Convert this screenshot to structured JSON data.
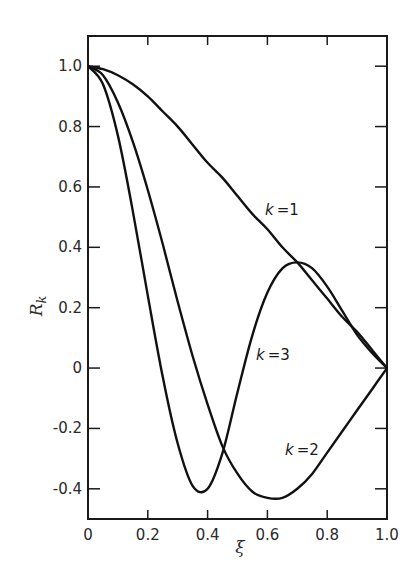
{
  "chart_data": {
    "type": "line",
    "title": "",
    "xlabel": "ξ",
    "ylabel": "R_k",
    "ylabel_main": "R",
    "ylabel_sub": "k",
    "xlim": [
      0,
      1.0
    ],
    "ylim": [
      -0.5,
      1.1
    ],
    "grid": false,
    "legend": "inline labels",
    "x_ticks": [
      "0",
      "0.2",
      "0.4",
      "0.6",
      "0.8",
      "1.0"
    ],
    "y_ticks": [
      "1.0",
      "0.8",
      "0.6",
      "0.4",
      "0.2",
      "0",
      "-0.2",
      "-0.4"
    ],
    "x": [
      0,
      0.05,
      0.1,
      0.15,
      0.2,
      0.25,
      0.3,
      0.35,
      0.4,
      0.45,
      0.5,
      0.55,
      0.6,
      0.65,
      0.7,
      0.75,
      0.8,
      0.85,
      0.9,
      0.95,
      1.0
    ],
    "series": [
      {
        "name": "k = 1",
        "label": "k = 1",
        "values": [
          1.0,
          0.99,
          0.97,
          0.94,
          0.9,
          0.85,
          0.8,
          0.74,
          0.68,
          0.63,
          0.57,
          0.51,
          0.46,
          0.4,
          0.35,
          0.29,
          0.23,
          0.17,
          0.12,
          0.06,
          0.0
        ]
      },
      {
        "name": "k = 2",
        "label": "k = 2",
        "values": [
          1.0,
          0.97,
          0.88,
          0.75,
          0.59,
          0.41,
          0.22,
          0.04,
          -0.12,
          -0.26,
          -0.35,
          -0.41,
          -0.43,
          -0.43,
          -0.4,
          -0.35,
          -0.28,
          -0.21,
          -0.14,
          -0.07,
          0.0
        ]
      },
      {
        "name": "k = 3",
        "label": "k = 3",
        "values": [
          1.0,
          0.94,
          0.77,
          0.52,
          0.24,
          -0.03,
          -0.25,
          -0.39,
          -0.4,
          -0.28,
          -0.08,
          0.11,
          0.25,
          0.33,
          0.35,
          0.33,
          0.27,
          0.19,
          0.11,
          0.05,
          0.0
        ]
      }
    ],
    "annotations": [
      {
        "text": "k = 1",
        "x": 0.6,
        "y": 0.42
      },
      {
        "text": "k = 3",
        "x": 0.53,
        "y": 0.1
      },
      {
        "text": "k = 2",
        "x": 0.68,
        "y": -0.28
      }
    ]
  },
  "labels": {
    "k1": "=1",
    "k2": "=2",
    "k3": "=3",
    "kvar": "k"
  }
}
